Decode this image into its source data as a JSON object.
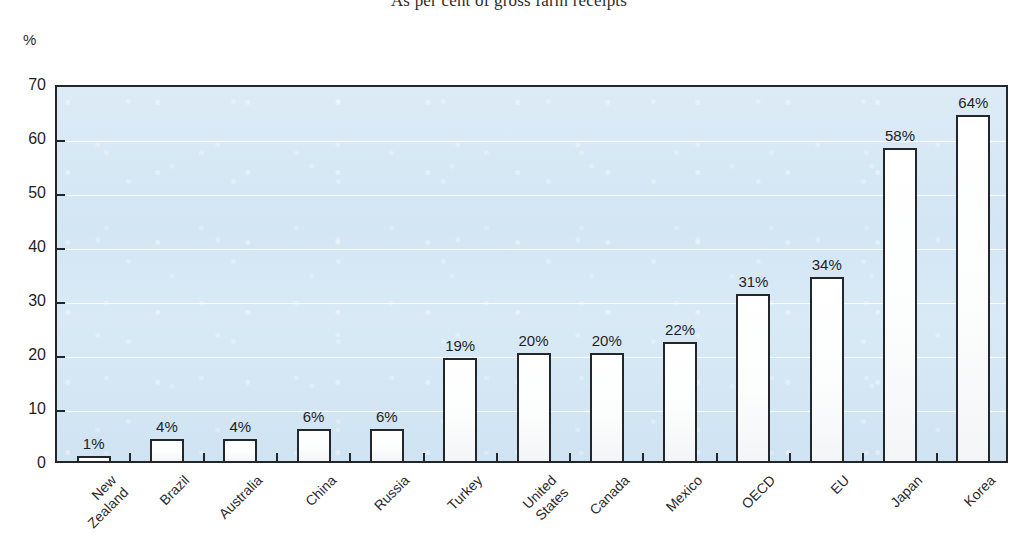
{
  "chart_title": "As per cent of gross farm receipts",
  "axis": {
    "unit_label": "%",
    "y_ticks": [
      "0",
      "10",
      "20",
      "30",
      "40",
      "50",
      "60",
      "70"
    ]
  },
  "colors": {
    "plot_background": "#d6e7f4",
    "bar_fill": "#ffffff",
    "bar_border": "#23262b",
    "gridline": "#ffffff",
    "text": "#1f1f1f"
  },
  "chart_data": {
    "type": "bar",
    "title": "As per cent of gross farm receipts",
    "xlabel": "",
    "ylabel": "%",
    "ylim": [
      0,
      70
    ],
    "yticks": [
      0,
      10,
      20,
      30,
      40,
      50,
      60,
      70
    ],
    "grid": true,
    "legend": null,
    "categories": [
      "New\nZealand",
      "Brazil",
      "Australia",
      "China",
      "Russia",
      "Turkey",
      "United\nStates",
      "Canada",
      "Mexico",
      "OECD",
      "EU",
      "Japan",
      "Korea"
    ],
    "values": [
      1,
      4,
      4,
      6,
      6,
      19,
      20,
      20,
      22,
      31,
      34,
      58,
      64
    ],
    "data_labels": [
      "1%",
      "4%",
      "4%",
      "6%",
      "6%",
      "19%",
      "20%",
      "20%",
      "22%",
      "31%",
      "34%",
      "58%",
      "64%"
    ]
  }
}
